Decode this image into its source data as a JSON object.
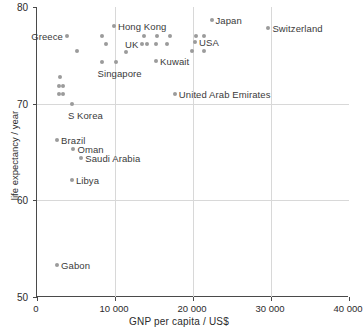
{
  "chart_data": {
    "type": "scatter",
    "title": "",
    "xlabel": "GNP per capita / US$",
    "ylabel": "life expectancy / year",
    "xlim": [
      0,
      40000
    ],
    "ylim": [
      50,
      80
    ],
    "xticks": [
      0,
      10000,
      20000,
      30000,
      40000
    ],
    "xtick_labels": [
      "0",
      "10 000",
      "20 000",
      "30 000",
      "40 000"
    ],
    "yticks": [
      50,
      60,
      70,
      80
    ],
    "ytick_labels": [
      "50",
      "60",
      "70",
      "80"
    ],
    "grid": "both",
    "legend": "none",
    "marker_color": "#9b9b9b",
    "label_color": "#3a3a3a",
    "axis_color": "#4a4a4a",
    "grid_color": "#d8d8d8",
    "points": [
      {
        "name": "Greece",
        "x": 4000,
        "y": 77.0,
        "label": "Greece",
        "label_side": "left"
      },
      {
        "name": "unlabelled-1",
        "x": 5200,
        "y": 75.4,
        "label": "",
        "label_side": "right"
      },
      {
        "name": "unlabelled-2",
        "x": 3100,
        "y": 72.8,
        "label": "",
        "label_side": "right"
      },
      {
        "name": "unlabelled-3",
        "x": 2900,
        "y": 71.8,
        "label": "",
        "label_side": "right"
      },
      {
        "name": "unlabelled-4",
        "x": 3500,
        "y": 71.8,
        "label": "",
        "label_side": "right"
      },
      {
        "name": "unlabelled-5",
        "x": 2900,
        "y": 71.0,
        "label": "",
        "label_side": "right"
      },
      {
        "name": "unlabelled-6",
        "x": 3500,
        "y": 71.0,
        "label": "",
        "label_side": "right"
      },
      {
        "name": "S Korea",
        "x": 4600,
        "y": 70.0,
        "label": "S Korea",
        "label_side": "below"
      },
      {
        "name": "Brazil",
        "x": 2700,
        "y": 66.2,
        "label": "Brazil",
        "label_side": "right"
      },
      {
        "name": "Oman",
        "x": 4800,
        "y": 65.3,
        "label": "Oman",
        "label_side": "right"
      },
      {
        "name": "Saudi Arabia",
        "x": 5800,
        "y": 64.4,
        "label": "Saudi Arabia",
        "label_side": "right"
      },
      {
        "name": "Libya",
        "x": 4600,
        "y": 62.1,
        "label": "Libya",
        "label_side": "right"
      },
      {
        "name": "Gabon",
        "x": 2700,
        "y": 53.3,
        "label": "Gabon",
        "label_side": "right"
      },
      {
        "name": "Singapore",
        "x": 8400,
        "y": 74.3,
        "label": "Singapore",
        "label_side": "below"
      },
      {
        "name": "unlabelled-7",
        "x": 8400,
        "y": 77.0,
        "label": "",
        "label_side": "right"
      },
      {
        "name": "unlabelled-8",
        "x": 9000,
        "y": 76.2,
        "label": "",
        "label_side": "right"
      },
      {
        "name": "Hong Kong",
        "x": 10000,
        "y": 78.0,
        "label": "Hong Kong",
        "label_side": "right"
      },
      {
        "name": "unlabelled-9",
        "x": 10200,
        "y": 74.3,
        "label": "",
        "label_side": "right"
      },
      {
        "name": "unlabelled-10",
        "x": 11600,
        "y": 75.3,
        "label": "",
        "label_side": "right"
      },
      {
        "name": "UK",
        "x": 13600,
        "y": 76.2,
        "label": "UK",
        "label_side": "left"
      },
      {
        "name": "unlabelled-11",
        "x": 14200,
        "y": 76.2,
        "label": "",
        "label_side": "right"
      },
      {
        "name": "unlabelled-12",
        "x": 13900,
        "y": 77.0,
        "label": "",
        "label_side": "right"
      },
      {
        "name": "unlabelled-13",
        "x": 15400,
        "y": 76.2,
        "label": "",
        "label_side": "right"
      },
      {
        "name": "unlabelled-14",
        "x": 15500,
        "y": 77.0,
        "label": "",
        "label_side": "right"
      },
      {
        "name": "unlabelled-15",
        "x": 16800,
        "y": 76.2,
        "label": "",
        "label_side": "right"
      },
      {
        "name": "unlabelled-16",
        "x": 17200,
        "y": 77.0,
        "label": "",
        "label_side": "right"
      },
      {
        "name": "Kuwait",
        "x": 15400,
        "y": 74.4,
        "label": "Kuwait",
        "label_side": "right"
      },
      {
        "name": "United Arab Emirates",
        "x": 17800,
        "y": 71.0,
        "label": "United Arab Emirates",
        "label_side": "right"
      },
      {
        "name": "unlabelled-17",
        "x": 20000,
        "y": 75.4,
        "label": "",
        "label_side": "right"
      },
      {
        "name": "USA",
        "x": 20400,
        "y": 76.4,
        "label": "USA",
        "label_side": "right"
      },
      {
        "name": "unlabelled-18",
        "x": 20500,
        "y": 77.0,
        "label": "",
        "label_side": "right"
      },
      {
        "name": "unlabelled-19",
        "x": 21500,
        "y": 77.0,
        "label": "",
        "label_side": "right"
      },
      {
        "name": "unlabelled-20",
        "x": 21500,
        "y": 75.4,
        "label": "",
        "label_side": "right"
      },
      {
        "name": "Japan",
        "x": 22500,
        "y": 78.7,
        "label": "Japan",
        "label_side": "right"
      },
      {
        "name": "Switzerland",
        "x": 29800,
        "y": 77.8,
        "label": "Switzerland",
        "label_side": "right"
      }
    ]
  }
}
